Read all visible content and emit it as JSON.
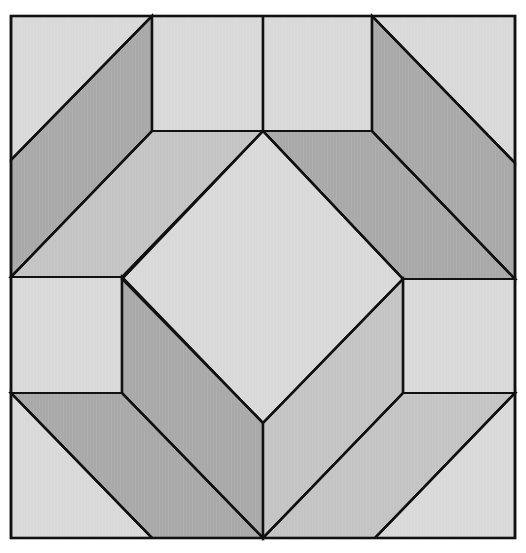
{
  "canvas": {
    "width": 526,
    "height": 553,
    "background": "#ffffff"
  },
  "colors": {
    "light": "#d9d9d9",
    "mid": "#c4c4c4",
    "dark": "#a9a9a9",
    "line": "#111111"
  },
  "outer": {
    "x": 11,
    "y": 16,
    "w": 504,
    "h": 522
  },
  "pieces": [
    {
      "name": "top-left-corner-triangle",
      "shade": "light",
      "points": "11,16 152,16 11,160"
    },
    {
      "name": "left-upper-parallelogram",
      "shade": "dark",
      "points": "152,16 152,131 11,277 11,160"
    },
    {
      "name": "top-left-square",
      "shade": "light",
      "points": "152,16 263,16 263,131 152,131"
    },
    {
      "name": "top-right-square",
      "shade": "light",
      "points": "263,16 372,16 372,131 263,131"
    },
    {
      "name": "upper-left-band",
      "shade": "mid",
      "points": "152,131 263,131 122,277 11,277"
    },
    {
      "name": "upper-right-band",
      "shade": "dark",
      "points": "263,131 372,131 515,279 403,279"
    },
    {
      "name": "top-right-corner-triangle",
      "shade": "light",
      "points": "372,16 515,16 515,163"
    },
    {
      "name": "right-upper-parallelogram",
      "shade": "dark",
      "points": "372,16 515,163 515,279 372,131"
    },
    {
      "name": "center-diamond",
      "shade": "light",
      "points": "263,131 403,279 263,423 122,279"
    },
    {
      "name": "left-middle-square",
      "shade": "light",
      "points": "11,277 122,277 122,393 11,393"
    },
    {
      "name": "right-middle-square",
      "shade": "light",
      "points": "403,279 515,279 515,393 403,393"
    },
    {
      "name": "lower-left-dark-face",
      "shade": "dark",
      "points": "122,277 122,393 263,538 263,423"
    },
    {
      "name": "lower-left-band",
      "shade": "dark",
      "points": "11,393 122,393 263,538 152,538"
    },
    {
      "name": "bottom-left-corner-triangle",
      "shade": "light",
      "points": "11,393 152,538 11,538"
    },
    {
      "name": "lower-right-mid-face",
      "shade": "mid",
      "points": "403,279 403,393 263,538 263,423"
    },
    {
      "name": "lower-right-band",
      "shade": "mid",
      "points": "403,393 515,393 375,538 263,538"
    },
    {
      "name": "bottom-right-corner-triangle",
      "shade": "light",
      "points": "515,393 515,538 375,538"
    }
  ]
}
